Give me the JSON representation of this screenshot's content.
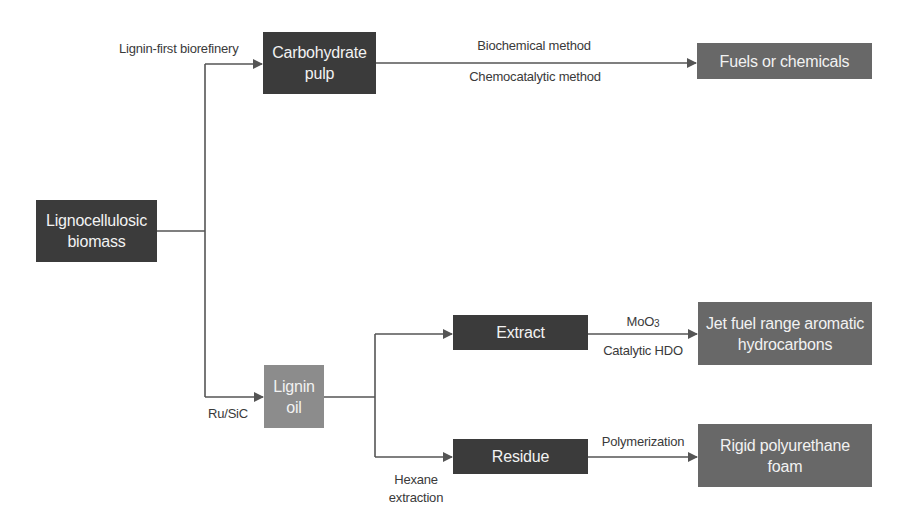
{
  "diagram": {
    "type": "flowchart",
    "nodes": {
      "biomass": {
        "line1": "Lignocellulosic",
        "line2": "biomass"
      },
      "carbohydrate_pulp": {
        "line1": "Carbohydrate",
        "line2": "pulp"
      },
      "fuels": {
        "label": "Fuels or chemicals"
      },
      "lignin_oil": {
        "line1": "Lignin",
        "line2": "oil"
      },
      "extract": {
        "label": "Extract"
      },
      "residue": {
        "label": "Residue"
      },
      "jet_fuel": {
        "line1": "Jet fuel range aromatic",
        "line2": "hydrocarbons"
      },
      "foam": {
        "line1": "Rigid polyurethane",
        "line2": "foam"
      }
    },
    "edge_labels": {
      "lignin_first": "Lignin-first biorefinery",
      "biochemical": "Biochemical method",
      "chemocatalytic": "Chemocatalytic method",
      "ru_sic": "Ru/SiC",
      "moo3_base": "MoO",
      "moo3_sub": "3",
      "catalytic_hdo": "Catalytic HDO",
      "polymerization": "Polymerization",
      "hexane_line1": "Hexane",
      "hexane_line2": "extraction"
    },
    "edges": [
      {
        "from": "Lignocellulosic biomass",
        "to": "Carbohydrate pulp",
        "label": "Lignin-first biorefinery"
      },
      {
        "from": "Carbohydrate pulp",
        "to": "Fuels or chemicals",
        "label": "Biochemical method / Chemocatalytic method"
      },
      {
        "from": "Lignocellulosic biomass",
        "to": "Lignin oil",
        "label": "Ru/SiC"
      },
      {
        "from": "Lignin oil",
        "to": "Extract",
        "label": ""
      },
      {
        "from": "Lignin oil",
        "to": "Residue",
        "label": "Hexane extraction"
      },
      {
        "from": "Extract",
        "to": "Jet fuel range aromatic hydrocarbons",
        "label": "MoO3 / Catalytic HDO"
      },
      {
        "from": "Residue",
        "to": "Rigid polyurethane foam",
        "label": "Polymerization"
      }
    ],
    "colors": {
      "dark_box": "#3b3b3b",
      "mid_box": "#686868",
      "light_box": "#8c8c8c",
      "line": "#555555",
      "text_light": "#f2f2f2",
      "text_dark": "#3a3a3a"
    }
  }
}
